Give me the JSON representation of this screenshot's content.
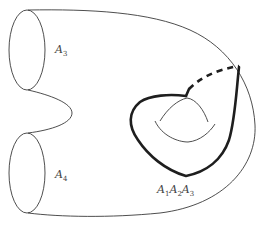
{
  "diagram": {
    "type": "surface-topology",
    "boundaries": [
      {
        "id": "upper",
        "label": "A",
        "subscript": "3"
      },
      {
        "id": "lower",
        "label": "A",
        "subscript": "4"
      }
    ],
    "loop_label": {
      "parts": [
        {
          "base": "A",
          "sub": "1"
        },
        {
          "base": "A",
          "sub": "2"
        },
        {
          "base": "A",
          "sub": "3"
        }
      ]
    },
    "colors": {
      "thin_stroke": "#3a3a3a",
      "thick_stroke": "#1e1e1e",
      "label": "#444444",
      "background": "#ffffff"
    }
  }
}
